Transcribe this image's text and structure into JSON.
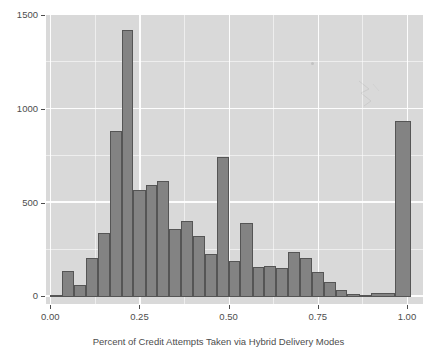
{
  "chart_data": {
    "type": "bar",
    "subtype": "histogram",
    "title": "",
    "xlabel": "Percent of Credit Attempts Taken via Hybrid Delivery Modes",
    "ylabel": "",
    "xlim": [
      -0.012,
      1.045
    ],
    "ylim": [
      -40,
      1500
    ],
    "grid": true,
    "legend": false,
    "binwidth": 0.0333,
    "x_ticks": [
      "0.00",
      "0.25",
      "0.50",
      "0.75",
      "1.00"
    ],
    "x_tick_values": [
      0.0,
      0.25,
      0.5,
      0.75,
      1.0
    ],
    "y_ticks": [
      "0",
      "500",
      "1000",
      "1500"
    ],
    "y_tick_values": [
      0,
      500,
      1000,
      1500
    ],
    "bar_fill": "#838383",
    "bar_outline": "#555555",
    "panel_background": "#d9d9d9",
    "gridline_color": "#ffffff",
    "bins": [
      {
        "x0": 0.0,
        "x1": 0.033,
        "count": 8
      },
      {
        "x0": 0.033,
        "x1": 0.067,
        "count": 135
      },
      {
        "x0": 0.067,
        "x1": 0.1,
        "count": 60
      },
      {
        "x0": 0.1,
        "x1": 0.133,
        "count": 205
      },
      {
        "x0": 0.133,
        "x1": 0.167,
        "count": 340
      },
      {
        "x0": 0.167,
        "x1": 0.2,
        "count": 880
      },
      {
        "x0": 0.2,
        "x1": 0.233,
        "count": 1420
      },
      {
        "x0": 0.233,
        "x1": 0.267,
        "count": 565
      },
      {
        "x0": 0.267,
        "x1": 0.3,
        "count": 595
      },
      {
        "x0": 0.3,
        "x1": 0.333,
        "count": 615
      },
      {
        "x0": 0.333,
        "x1": 0.367,
        "count": 360
      },
      {
        "x0": 0.367,
        "x1": 0.4,
        "count": 400
      },
      {
        "x0": 0.4,
        "x1": 0.433,
        "count": 320
      },
      {
        "x0": 0.433,
        "x1": 0.467,
        "count": 225
      },
      {
        "x0": 0.467,
        "x1": 0.5,
        "count": 745
      },
      {
        "x0": 0.5,
        "x1": 0.533,
        "count": 190
      },
      {
        "x0": 0.533,
        "x1": 0.567,
        "count": 390
      },
      {
        "x0": 0.567,
        "x1": 0.6,
        "count": 155
      },
      {
        "x0": 0.6,
        "x1": 0.633,
        "count": 165
      },
      {
        "x0": 0.633,
        "x1": 0.667,
        "count": 150
      },
      {
        "x0": 0.667,
        "x1": 0.7,
        "count": 235
      },
      {
        "x0": 0.7,
        "x1": 0.733,
        "count": 205
      },
      {
        "x0": 0.733,
        "x1": 0.767,
        "count": 130
      },
      {
        "x0": 0.767,
        "x1": 0.8,
        "count": 75
      },
      {
        "x0": 0.8,
        "x1": 0.833,
        "count": 35
      },
      {
        "x0": 0.833,
        "x1": 0.867,
        "count": 12
      },
      {
        "x0": 0.867,
        "x1": 0.9,
        "count": 10
      },
      {
        "x0": 0.9,
        "x1": 0.967,
        "count": 18
      },
      {
        "x0": 0.967,
        "x1": 1.01,
        "count": 935
      }
    ]
  }
}
